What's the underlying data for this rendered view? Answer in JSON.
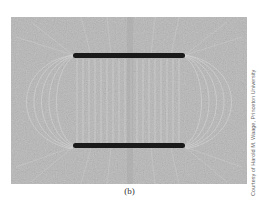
{
  "figure": {
    "caption": "(b)",
    "credit": "Courtesy of Harold M. Waage, Princeton University",
    "colors": {
      "background": "#b9b9b9",
      "plates": "#1a1a1a",
      "field_lines": "#e6e6e6"
    }
  }
}
